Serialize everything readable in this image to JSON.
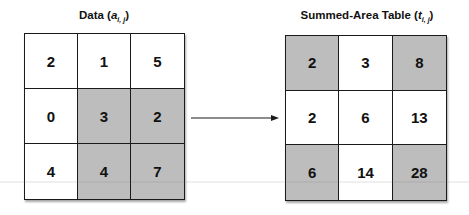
{
  "left_panel": {
    "title_prefix": "Data (",
    "title_var": "a",
    "title_sub": "i, j",
    "title_suffix": ")",
    "cells": [
      [
        {
          "value": "2",
          "highlighted": false
        },
        {
          "value": "1",
          "highlighted": false
        },
        {
          "value": "5",
          "highlighted": false
        }
      ],
      [
        {
          "value": "0",
          "highlighted": false
        },
        {
          "value": "3",
          "highlighted": true
        },
        {
          "value": "2",
          "highlighted": true
        }
      ],
      [
        {
          "value": "4",
          "highlighted": false
        },
        {
          "value": "4",
          "highlighted": true
        },
        {
          "value": "7",
          "highlighted": true
        }
      ]
    ]
  },
  "right_panel": {
    "title_prefix": "Summed-Area Table (",
    "title_var": "t",
    "title_sub": "i, j",
    "title_suffix": ")",
    "cells": [
      [
        {
          "value": "2",
          "highlighted": true
        },
        {
          "value": "3",
          "highlighted": false
        },
        {
          "value": "8",
          "highlighted": true
        }
      ],
      [
        {
          "value": "2",
          "highlighted": false
        },
        {
          "value": "6",
          "highlighted": false
        },
        {
          "value": "13",
          "highlighted": false
        }
      ],
      [
        {
          "value": "6",
          "highlighted": true
        },
        {
          "value": "14",
          "highlighted": false
        },
        {
          "value": "28",
          "highlighted": true
        }
      ]
    ]
  },
  "arrow": {
    "direction": "right",
    "icon": "arrow-right-icon"
  },
  "colors": {
    "highlight": "#bdbdbd",
    "border": "#1a1a1a",
    "background": "#ffffff"
  }
}
